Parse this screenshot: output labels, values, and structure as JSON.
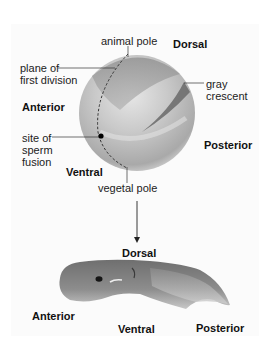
{
  "egg": {
    "labels": {
      "animal_pole": "animal pole",
      "dorsal": "Dorsal",
      "plane_line1": "plane of",
      "plane_line2": "first division",
      "anterior": "Anterior",
      "gray_line1": "gray",
      "gray_line2": "crescent",
      "sperm_line1": "site of",
      "sperm_line2": "sperm",
      "sperm_line3": "fusion",
      "posterior": "Posterior",
      "ventral": "Ventral",
      "vegetal_pole": "vegetal pole"
    }
  },
  "tadpole": {
    "labels": {
      "dorsal": "Dorsal",
      "anterior": "Anterior",
      "ventral": "Ventral",
      "posterior": "Posterior"
    }
  },
  "colors": {
    "background": "#ffffff",
    "panel": "#fbfbfb",
    "label_text": "#222222",
    "leader_line": "#333333"
  }
}
